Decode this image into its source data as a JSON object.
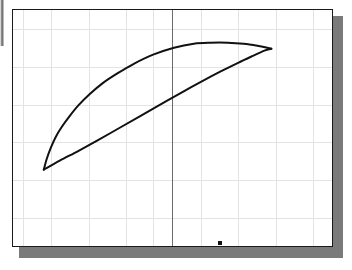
{
  "figure": {
    "title": "",
    "background_color": "#ffffff",
    "panel": {
      "left": 12,
      "top": 9,
      "width": 321,
      "height": 238,
      "fill": "#ffffff",
      "border_color": "#1a1a1a",
      "border_width": 1
    },
    "shadow": {
      "left": 19,
      "top": 16,
      "width": 324,
      "height": 242,
      "color": "#7a7a7a"
    },
    "left_edge_strip": {
      "left": 0,
      "top": 0,
      "width": 4,
      "height": 46,
      "color": "#6f6f6f"
    }
  },
  "chart_data": {
    "type": "line",
    "title": "",
    "xlabel": "",
    "ylabel": "",
    "grid": true,
    "legend": null,
    "xlim": [
      0,
      321
    ],
    "ylim": [
      0,
      238
    ],
    "grid_color": "#e3e3e3",
    "axis_line_color": "#6b6b6b",
    "curve_color": "#111111",
    "curve_width": 2,
    "vertical_axis_x": 159,
    "grid_vertical_x": [
      10,
      38,
      76,
      113,
      140,
      159,
      188,
      225,
      263,
      300
    ],
    "grid_horizontal_y": [
      19,
      57,
      95,
      132,
      170,
      208,
      238
    ],
    "series": [
      {
        "name": "upper-arc",
        "description": "Upper convex arc of the lens from left cusp to right vertex",
        "points": [
          [
            31,
            161
          ],
          [
            34,
            150
          ],
          [
            38,
            139
          ],
          [
            43,
            128
          ],
          [
            49,
            118
          ],
          [
            57,
            107
          ],
          [
            66,
            96
          ],
          [
            77,
            85
          ],
          [
            90,
            74
          ],
          [
            105,
            64
          ],
          [
            122,
            54
          ],
          [
            141,
            45
          ],
          [
            162,
            38
          ],
          [
            182,
            34
          ],
          [
            199,
            33
          ],
          [
            216,
            33
          ],
          [
            232,
            34
          ],
          [
            246,
            36
          ],
          [
            256,
            38
          ],
          [
            260,
            39
          ]
        ]
      },
      {
        "name": "lower-chord",
        "description": "Lower nearly-straight arc of the lens from left cusp to right vertex",
        "points": [
          [
            31,
            161
          ],
          [
            47,
            152
          ],
          [
            66,
            142
          ],
          [
            86,
            131
          ],
          [
            107,
            119
          ],
          [
            128,
            107
          ],
          [
            149,
            95
          ],
          [
            170,
            83
          ],
          [
            190,
            72
          ],
          [
            209,
            62
          ],
          [
            227,
            53
          ],
          [
            242,
            46
          ],
          [
            253,
            41
          ],
          [
            260,
            39
          ]
        ]
      }
    ],
    "annotations": [
      {
        "name": "dot-marker",
        "type": "point",
        "shape": "square",
        "x": 205,
        "y": 231,
        "size": 4,
        "color": "#111111"
      }
    ],
    "vertices": {
      "left_cusp": [
        31,
        161
      ],
      "right_vertex": [
        260,
        39
      ],
      "apex": [
        216,
        33
      ]
    }
  }
}
